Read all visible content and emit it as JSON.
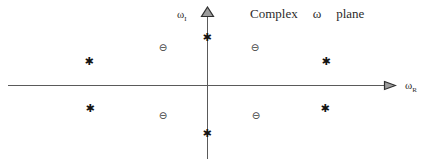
{
  "diagram": {
    "title_parts": [
      "Complex",
      "ω",
      "plane"
    ],
    "axis_labels": {
      "vertical_base": "ω",
      "vertical_sub": "I",
      "horizontal_base": "ω",
      "horizontal_sub": "R"
    },
    "marker_glyphs": {
      "star": "✱",
      "circle": "⊖"
    },
    "colors": {
      "background": "#ffffff",
      "axis": "#5a5a5a",
      "marker_star": "#141414",
      "marker_circle": "#3a3a3a",
      "arrowhead_fill": "#9c9c9c",
      "arrowhead_stroke": "#2f2f2f",
      "text": "#2b2b2b"
    },
    "markers": {
      "stars": [
        {
          "x": 89,
          "y": 61
        },
        {
          "x": 207,
          "y": 37
        },
        {
          "x": 326,
          "y": 61
        },
        {
          "x": 90,
          "y": 108
        },
        {
          "x": 207,
          "y": 133
        },
        {
          "x": 325,
          "y": 108
        }
      ],
      "circles": [
        {
          "x": 163,
          "y": 48
        },
        {
          "x": 255,
          "y": 48
        },
        {
          "x": 163,
          "y": 116
        },
        {
          "x": 256,
          "y": 116
        }
      ]
    }
  }
}
